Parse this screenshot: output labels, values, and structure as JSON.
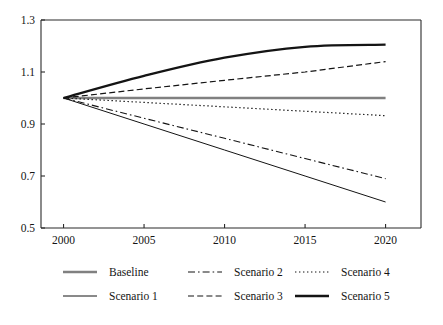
{
  "chart_data": {
    "type": "line",
    "title": "",
    "subtitle": "",
    "xlabel": "",
    "ylabel": "",
    "x": [
      2000,
      2005,
      2010,
      2015,
      2020
    ],
    "xlim": [
      1998.6,
      2022.2
    ],
    "ylim": [
      0.5,
      1.3
    ],
    "xticks": [
      2000,
      2005,
      2010,
      2015,
      2020
    ],
    "xtick_labels": [
      "2000",
      "2005",
      "2010",
      "2015",
      "2020"
    ],
    "yticks": [
      0.5,
      0.7,
      0.9,
      1.1,
      1.3
    ],
    "ytick_labels": [
      "0.5",
      "0.7",
      "0.9",
      "1.1",
      "1.3"
    ],
    "grid": false,
    "legend_position": "bottom",
    "series": [
      {
        "name": "Baseline",
        "values": [
          1.0,
          1.0,
          1.0,
          1.0,
          1.0
        ],
        "style": "solid",
        "color": "#808080",
        "width": 2.6,
        "dash": ""
      },
      {
        "name": "Scenario 1",
        "values": [
          1.0,
          0.9,
          0.8,
          0.7,
          0.6
        ],
        "style": "solid",
        "color": "#141414",
        "width": 1.0,
        "dash": ""
      },
      {
        "name": "Scenario 2",
        "values": [
          1.0,
          0.922,
          0.845,
          0.767,
          0.69
        ],
        "style": "dash-dot",
        "color": "#141414",
        "width": 1.1,
        "dash": "7,3,1.6,3"
      },
      {
        "name": "Scenario 3",
        "values": [
          1.0,
          1.035,
          1.068,
          1.1,
          1.14
        ],
        "style": "dashed",
        "color": "#141414",
        "width": 1.2,
        "dash": "6,3.2"
      },
      {
        "name": "Scenario 4",
        "values": [
          1.0,
          0.983,
          0.966,
          0.949,
          0.932
        ],
        "style": "dotted",
        "color": "#141414",
        "width": 1.2,
        "dash": "1.4,2.6"
      },
      {
        "name": "Scenario 5",
        "values": [
          1.0,
          1.085,
          1.155,
          1.197,
          1.205
        ],
        "style": "solid",
        "color": "#141414",
        "width": 2.3,
        "dash": ""
      }
    ]
  },
  "legend": {
    "entries": [
      {
        "label": "Baseline",
        "row": 0,
        "col": 0
      },
      {
        "label": "Scenario 2",
        "row": 0,
        "col": 1
      },
      {
        "label": "Scenario 4",
        "row": 0,
        "col": 2
      },
      {
        "label": "Scenario 1",
        "row": 1,
        "col": 0
      },
      {
        "label": "Scenario 3",
        "row": 1,
        "col": 1
      },
      {
        "label": "Scenario 5",
        "row": 1,
        "col": 2
      }
    ]
  }
}
